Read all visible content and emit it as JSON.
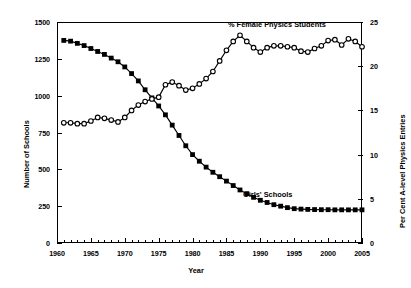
{
  "chart_data": {
    "type": "line",
    "title": "",
    "xlabel": "Year",
    "ylabel": "Number of Schools",
    "y2label": "Per Cent A-level Physics Entries",
    "xlim": [
      1960,
      2005
    ],
    "ylim": [
      0,
      1500
    ],
    "y2lim": [
      0,
      25
    ],
    "xticks": [
      1960,
      1965,
      1970,
      1975,
      1980,
      1985,
      1990,
      1995,
      2000,
      2005
    ],
    "xtick_labels": [
      "1960",
      "1965",
      "1970",
      "1975",
      "1980",
      "1985",
      "1990",
      "1995",
      "2000",
      "2005"
    ],
    "yticks": [
      0,
      250,
      500,
      750,
      1000,
      1250,
      1500
    ],
    "ytick_labels": [
      "0",
      "250",
      "500",
      "750",
      "1000",
      "1250",
      "1500"
    ],
    "y2ticks": [
      0,
      5,
      10,
      15,
      20,
      25
    ],
    "y2tick_labels": [
      "0",
      "5",
      "10",
      "15",
      "20",
      "25"
    ],
    "minor_xticks": true,
    "grid": false,
    "legend_position": "inline-annotations",
    "series": [
      {
        "name": "Girls' Schools",
        "axis": "left",
        "marker": "filled-square",
        "color": "#000000",
        "annotation": "Girls' Schools",
        "x": [
          1961,
          1962,
          1963,
          1964,
          1965,
          1966,
          1967,
          1968,
          1969,
          1970,
          1971,
          1972,
          1973,
          1974,
          1975,
          1976,
          1977,
          1978,
          1979,
          1980,
          1981,
          1982,
          1983,
          1984,
          1985,
          1986,
          1987,
          1988,
          1989,
          1990,
          1991,
          1992,
          1993,
          1994,
          1995,
          1996,
          1997,
          1998,
          1999,
          2000,
          2001,
          2002,
          2003,
          2004,
          2005
        ],
        "values": [
          1375,
          1370,
          1355,
          1340,
          1320,
          1300,
          1280,
          1255,
          1230,
          1195,
          1150,
          1100,
          1040,
          985,
          930,
          870,
          800,
          730,
          660,
          600,
          555,
          515,
          480,
          450,
          420,
          390,
          360,
          335,
          310,
          290,
          275,
          260,
          250,
          240,
          233,
          230,
          228,
          227,
          226,
          226,
          225,
          225,
          225,
          225,
          225
        ]
      },
      {
        "name": "% Female Physics Students",
        "axis": "right",
        "marker": "open-circle",
        "color": "#000000",
        "annotation": "% Female Physics Students",
        "x": [
          1961,
          1962,
          1963,
          1964,
          1965,
          1966,
          1967,
          1968,
          1969,
          1970,
          1971,
          1972,
          1973,
          1974,
          1975,
          1976,
          1977,
          1978,
          1979,
          1980,
          1981,
          1982,
          1983,
          1984,
          1985,
          1986,
          1987,
          1988,
          1989,
          1990,
          1991,
          1992,
          1993,
          1994,
          1995,
          1996,
          1997,
          1998,
          1999,
          2000,
          2001,
          2002,
          2003,
          2004,
          2005
        ],
        "values": [
          13.6,
          13.6,
          13.5,
          13.5,
          13.8,
          14.2,
          14.1,
          13.9,
          13.7,
          14.2,
          15.0,
          15.6,
          16.0,
          16.3,
          16.5,
          17.9,
          18.2,
          17.8,
          17.3,
          17.5,
          18.0,
          18.6,
          19.4,
          20.6,
          21.8,
          22.8,
          23.5,
          22.8,
          22.1,
          21.6,
          22.1,
          22.3,
          22.3,
          22.2,
          22.1,
          21.7,
          21.6,
          22.0,
          22.3,
          22.9,
          23.0,
          22.4,
          23.1,
          22.8,
          22.2
        ]
      }
    ]
  }
}
